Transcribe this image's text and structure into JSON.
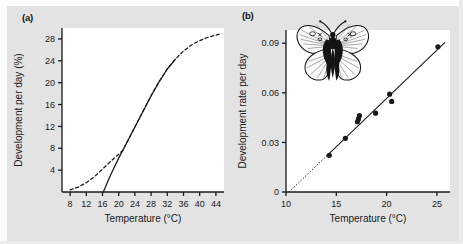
{
  "figure": {
    "background_color": "#e3e3e3",
    "ink_color": "#1a1a1a",
    "plot_background": "#ffffff"
  },
  "panels": [
    {
      "label": "(a)",
      "xlabel": "Temperature (°C)",
      "ylabel": "Development per day (%)",
      "xticks": [
        "8",
        "12",
        "16",
        "20",
        "24",
        "28",
        "32",
        "36",
        "40",
        "44"
      ],
      "yticks": [
        "4",
        "8",
        "12",
        "16",
        "20",
        "24",
        "28"
      ]
    },
    {
      "label": "(b)",
      "xlabel": "Temperature (°C)",
      "ylabel": "Development rate per day",
      "xticks": [
        "10",
        "15",
        "20",
        "25"
      ],
      "yticks": [
        "0",
        "0.03",
        "0.06",
        "0.09"
      ],
      "inset_icon": "butterfly-illustration"
    }
  ],
  "chart_data": [
    {
      "type": "line",
      "panel": "(a)",
      "title": "",
      "xlabel": "Temperature (°C)",
      "ylabel": "Development per day (%)",
      "xlim": [
        6,
        46
      ],
      "ylim": [
        0,
        30
      ],
      "xticks": [
        8,
        12,
        16,
        20,
        24,
        28,
        32,
        36,
        40,
        44
      ],
      "yticks": [
        4,
        8,
        12,
        16,
        20,
        24,
        28
      ],
      "grid": false,
      "legend": "none",
      "series": [
        {
          "name": "Sigmoid development curve (extrapolated, dashed)",
          "style": "dashed",
          "x": [
            8,
            10,
            12,
            14,
            16,
            18,
            20,
            21,
            24,
            28,
            30,
            32,
            34,
            36,
            38,
            40,
            42,
            44,
            45
          ],
          "y": [
            0.4,
            0.9,
            1.7,
            2.8,
            4.2,
            5.6,
            6.9,
            7.6,
            11.9,
            17.6,
            20.2,
            22.5,
            24.3,
            25.8,
            26.9,
            27.7,
            28.3,
            28.7,
            28.9
          ]
        },
        {
          "name": "Measured sigmoid segment (solid)",
          "style": "solid",
          "x": [
            21,
            24,
            28,
            30,
            32,
            34
          ],
          "y": [
            7.6,
            11.9,
            17.6,
            20.2,
            22.5,
            24.3
          ]
        },
        {
          "name": "Linear approximation (solid straight line)",
          "style": "solid",
          "x": [
            16.2,
            18,
            20,
            21
          ],
          "y": [
            0.0,
            3.1,
            6.2,
            7.6
          ]
        }
      ]
    },
    {
      "type": "scatter",
      "panel": "(b)",
      "title": "",
      "xlabel": "Temperature (°C)",
      "ylabel": "Development rate per day",
      "xlim": [
        10,
        26.3
      ],
      "ylim": [
        0,
        0.098
      ],
      "xticks": [
        10,
        15,
        20,
        25
      ],
      "yticks": [
        0,
        0.03,
        0.06,
        0.09
      ],
      "grid": false,
      "legend": "none",
      "points": [
        {
          "x": 14.3,
          "y": 0.0222
        },
        {
          "x": 15.9,
          "y": 0.0325
        },
        {
          "x": 17.1,
          "y": 0.0425
        },
        {
          "x": 17.2,
          "y": 0.0442
        },
        {
          "x": 17.3,
          "y": 0.0462
        },
        {
          "x": 18.9,
          "y": 0.0477
        },
        {
          "x": 20.3,
          "y": 0.0592
        },
        {
          "x": 20.5,
          "y": 0.0548
        },
        {
          "x": 25.1,
          "y": 0.0878
        }
      ],
      "fit_line": {
        "name": "Linear regression (extrapolated to x-intercept, dotted below data)",
        "x_start": 10.3,
        "y_start": 0.0,
        "x_end": 25.8,
        "y_end": 0.0905
      }
    }
  ]
}
